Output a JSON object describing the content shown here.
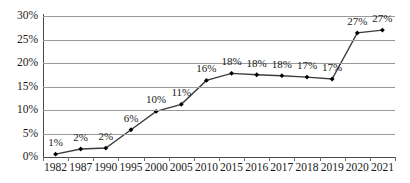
{
  "chart_data": {
    "type": "line",
    "title": "",
    "subtitle": "",
    "xlabel": "",
    "ylabel": "",
    "categories": [
      "1982",
      "1987",
      "1990",
      "1995",
      "2000",
      "2005",
      "2010",
      "2015",
      "2016",
      "2017",
      "2018",
      "2019",
      "2020",
      "2021"
    ],
    "values": [
      0.6,
      1.7,
      1.9,
      5.8,
      9.7,
      11.2,
      16.3,
      17.8,
      17.5,
      17.3,
      17.0,
      16.6,
      26.4,
      27.0
    ],
    "point_labels": [
      "1%",
      "2%",
      "2%",
      "6%",
      "10%",
      "11%",
      "16%",
      "18%",
      "18%",
      "18%",
      "17%",
      "17%",
      "27%",
      "27%"
    ],
    "ylim": [
      0,
      30
    ],
    "ytick_values": [
      0,
      5,
      10,
      15,
      20,
      25,
      30
    ],
    "ytick_labels": [
      "0%",
      "5%",
      "10%",
      "15%",
      "20%",
      "25%",
      "30%"
    ],
    "grid": true,
    "legend": "none",
    "series_color": "#3d3d3d",
    "marker_color": "#000000",
    "grid_color": "#9a9a9a",
    "axis_color": "#4a4a4a"
  }
}
